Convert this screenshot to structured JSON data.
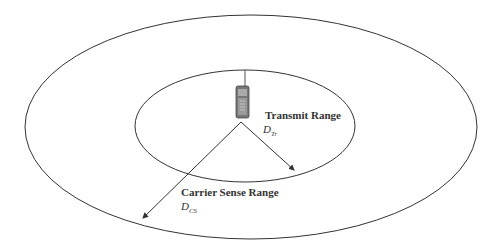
{
  "diagram": {
    "transmit_range": {
      "label": "Transmit Range",
      "symbol": "D",
      "subscript": "Tr"
    },
    "carrier_sense_range": {
      "label": "Carrier Sense Range",
      "symbol": "D",
      "subscript": "CS"
    },
    "device": "mobile-phone-icon",
    "colors": {
      "line": "#333333",
      "background": "#ffffff"
    }
  }
}
